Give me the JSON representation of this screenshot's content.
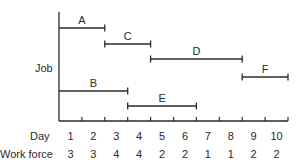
{
  "chart_data": {
    "type": "gantt",
    "title": "",
    "ylabel": "Job",
    "xlabel": "Day",
    "days": [
      1,
      2,
      3,
      4,
      5,
      6,
      7,
      8,
      9,
      10
    ],
    "work_force_label": "Work force",
    "work_force": [
      3,
      3,
      4,
      4,
      2,
      2,
      1,
      1,
      2,
      2
    ],
    "jobs": [
      {
        "name": "A",
        "start_day": 1,
        "end_day": 2
      },
      {
        "name": "C",
        "start_day": 3,
        "end_day": 4
      },
      {
        "name": "D",
        "start_day": 5,
        "end_day": 8
      },
      {
        "name": "F",
        "start_day": 9,
        "end_day": 10
      },
      {
        "name": "B",
        "start_day": 1,
        "end_day": 3
      },
      {
        "name": "E",
        "start_day": 4,
        "end_day": 6
      }
    ],
    "line_color": "#2a2a2a"
  }
}
